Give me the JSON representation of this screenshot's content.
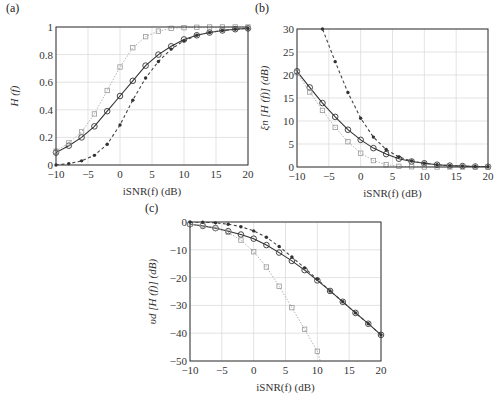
{
  "chart_data": [
    {
      "panel": "(a)",
      "type": "line",
      "title": "",
      "xlabel": "iSNR(f) (dB)",
      "ylabel": "H (f)",
      "xlim": [
        -10,
        20
      ],
      "ylim": [
        0,
        1
      ],
      "xticks": [
        -10,
        -5,
        0,
        5,
        10,
        15,
        20
      ],
      "yticks": [
        0,
        0.2,
        0.4,
        0.6,
        0.8,
        1
      ],
      "ytick_labels": [
        "0",
        "0.2",
        "0.4",
        "0.6",
        "0.8",
        "1"
      ],
      "grid": true,
      "x": [
        -10,
        -8,
        -6,
        -4,
        -2,
        0,
        2,
        4,
        6,
        8,
        10,
        12,
        14,
        16,
        18,
        20
      ],
      "series": [
        {
          "name": "circle-solid",
          "style": "solid",
          "marker": "circle",
          "color": "#333333",
          "values": [
            0.09,
            0.14,
            0.2,
            0.28,
            0.39,
            0.5,
            0.61,
            0.72,
            0.8,
            0.86,
            0.91,
            0.94,
            0.96,
            0.975,
            0.984,
            0.99
          ]
        },
        {
          "name": "square-dotted",
          "style": "dotted",
          "marker": "square",
          "color": "#999999",
          "values": [
            0.1,
            0.16,
            0.24,
            0.37,
            0.54,
            0.71,
            0.85,
            0.93,
            0.97,
            0.99,
            0.995,
            0.998,
            1.0,
            1.0,
            1.0,
            1.0
          ]
        },
        {
          "name": "star-dashed",
          "style": "dashed",
          "marker": "star",
          "color": "#444444",
          "values": [
            0.0,
            0.01,
            0.03,
            0.07,
            0.15,
            0.29,
            0.47,
            0.63,
            0.75,
            0.84,
            0.9,
            0.94,
            0.96,
            0.975,
            0.984,
            0.99
          ]
        }
      ]
    },
    {
      "panel": "(b)",
      "type": "line",
      "title": "",
      "xlabel": "iSNR(f) (dB)",
      "ylabel": "ξn [H (f)] (dB)",
      "xlim": [
        -10,
        20
      ],
      "ylim": [
        0,
        30
      ],
      "xticks": [
        -10,
        -5,
        0,
        5,
        10,
        15,
        20
      ],
      "yticks": [
        0,
        5,
        10,
        15,
        20,
        25,
        30
      ],
      "ytick_labels": [
        "0",
        "5",
        "10",
        "15",
        "20",
        "25",
        "30"
      ],
      "grid": true,
      "x": [
        -10,
        -8,
        -6,
        -4,
        -2,
        0,
        2,
        4,
        6,
        8,
        10,
        12,
        14,
        16,
        18,
        20
      ],
      "series": [
        {
          "name": "circle-solid",
          "style": "solid",
          "marker": "circle",
          "color": "#333333",
          "values": [
            20.8,
            17.3,
            13.9,
            10.9,
            8.1,
            5.9,
            4.1,
            2.8,
            1.8,
            1.2,
            0.8,
            0.5,
            0.3,
            0.2,
            0.1,
            0.05
          ]
        },
        {
          "name": "square-dotted",
          "style": "dotted",
          "marker": "square",
          "color": "#999999",
          "values": [
            20.5,
            16.3,
            12.3,
            8.6,
            5.5,
            3.0,
            1.4,
            0.5,
            0.15,
            0.05,
            0.0,
            0.0,
            0.0,
            0.0,
            0.0,
            0.0
          ]
        },
        {
          "name": "star-dashed",
          "style": "dashed",
          "marker": "star",
          "color": "#444444",
          "values": [
            null,
            null,
            30.0,
            22.9,
            16.2,
            10.6,
            6.5,
            3.8,
            2.2,
            1.3,
            0.8,
            0.5,
            0.3,
            0.2,
            0.1,
            0.05
          ]
        }
      ]
    },
    {
      "panel": "(c)",
      "type": "line",
      "title": "",
      "xlabel": "iSNR(f) (dB)",
      "ylabel": "υd [H (f)] (dB)",
      "xlim": [
        -10,
        20
      ],
      "ylim": [
        -50,
        0
      ],
      "xticks": [
        -10,
        -5,
        0,
        5,
        10,
        15,
        20
      ],
      "yticks": [
        -50,
        -40,
        -30,
        -20,
        -10,
        0
      ],
      "ytick_labels": [
        "−50",
        "−40",
        "−30",
        "−20",
        "−10",
        "0"
      ],
      "grid": true,
      "x": [
        -10,
        -8,
        -6,
        -4,
        -2,
        0,
        2,
        4,
        6,
        8,
        10,
        12,
        14,
        16,
        18,
        20
      ],
      "series": [
        {
          "name": "circle-solid",
          "style": "solid",
          "marker": "circle",
          "color": "#333333",
          "values": [
            -0.8,
            -1.4,
            -2.2,
            -3.3,
            -4.5,
            -6.0,
            -8.3,
            -11.0,
            -14.0,
            -17.3,
            -21.0,
            -24.8,
            -28.7,
            -32.7,
            -36.6,
            -40.6
          ]
        },
        {
          "name": "square-dotted",
          "style": "dotted",
          "marker": "square",
          "color": "#999999",
          "values": [
            -0.8,
            -1.3,
            -2.2,
            -3.7,
            -6.5,
            -10.7,
            -16.2,
            -23.1,
            -30.8,
            -38.6,
            -46.5,
            null,
            null,
            null,
            null,
            null
          ]
        },
        {
          "name": "star-dashed",
          "style": "dashed",
          "marker": "star",
          "color": "#444444",
          "values": [
            0.0,
            -0.1,
            -0.3,
            -0.8,
            -1.7,
            -3.2,
            -5.5,
            -8.8,
            -12.6,
            -16.5,
            -20.6,
            -24.8,
            -28.7,
            -32.7,
            -36.6,
            -40.6
          ]
        }
      ]
    }
  ]
}
